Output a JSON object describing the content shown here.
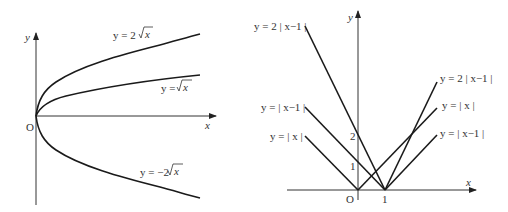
{
  "left_graph": {
    "axis_labels": {
      "x": "x",
      "y": "y",
      "origin": "O"
    },
    "curves": [
      {
        "label_prefix": "y = 2",
        "label_radicand": "x",
        "equation": "y = 2√x"
      },
      {
        "label_prefix": "y = ",
        "label_radicand": "x",
        "equation": "y = √x"
      },
      {
        "label_prefix": "y = −2",
        "label_radicand": "x",
        "equation": "y = −2√x"
      }
    ]
  },
  "right_graph": {
    "axis_labels": {
      "x": "x",
      "y": "y",
      "origin": "O"
    },
    "ticks": {
      "x1": "1",
      "y1": "1",
      "y2": "2"
    },
    "lines_left": [
      {
        "label": "y = 2 | x−1 |"
      },
      {
        "label": "y = | x−1 |"
      },
      {
        "label": "y = | x |"
      }
    ],
    "lines_right": [
      {
        "label": "y = 2 | x−1 |"
      },
      {
        "label": "y = | x |"
      },
      {
        "label": "y = | x−1 |"
      }
    ]
  },
  "colors": {
    "stroke": "#1a1a1a",
    "axis": "#333333",
    "background": "#ffffff"
  }
}
